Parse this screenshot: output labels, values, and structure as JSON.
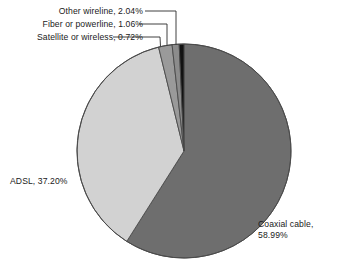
{
  "chart_data": {
    "type": "pie",
    "title": "",
    "subtitle": "",
    "xlabel": "",
    "ylabel": "",
    "legend_position": "none",
    "grid": false,
    "units": "percent",
    "start_angle_deg": 0,
    "direction": "clockwise",
    "categories": [
      "Coaxial cable",
      "ADSL",
      "Other wireline",
      "Fiber or powerline",
      "Satellite or wireless"
    ],
    "values": [
      58.99,
      37.2,
      2.04,
      1.06,
      0.72
    ],
    "labels": [
      "Coaxial cable, 58.99%",
      "ADSL, 37.20%",
      "Other wireline, 2.04%",
      "Fiber or powerline, 1.06%",
      "Satellite or wireless, 0.72%"
    ],
    "colors": [
      "#6e6e6e",
      "#d2d2d2",
      "#9a9a9a",
      "#8c8c8c",
      "#121212"
    ],
    "slices": [
      {
        "name": "Coaxial cable",
        "value": 58.99,
        "label": "Coaxial cable,",
        "label_line2": "58.99%",
        "color": "#6e6e6e"
      },
      {
        "name": "ADSL",
        "value": 37.2,
        "label": "ADSL, 37.20%",
        "color": "#d2d2d2"
      },
      {
        "name": "Other wireline",
        "value": 2.04,
        "label": "Other wireline, 2.04%",
        "color": "#9a9a9a"
      },
      {
        "name": "Fiber or powerline",
        "value": 1.06,
        "label": "Fiber or powerline, 1.06%",
        "color": "#8c8c8c"
      },
      {
        "name": "Satellite or wireless",
        "value": 0.72,
        "label": "Satellite or wireless, 0.72%",
        "color": "#121212"
      }
    ]
  },
  "callouts": {
    "other_wireline": "Other wireline, 2.04%",
    "fiber_or_powerline": "Fiber or powerline, 1.06%",
    "satellite_or_wireless": "Satellite or wireless, 0.72%"
  },
  "inner_labels": {
    "adsl": "ADSL, 37.20%",
    "coaxial_line1": "Coaxial cable,",
    "coaxial_line2": "58.99%"
  },
  "colors": {
    "background": "#ffffff",
    "outline": "#4a4a4a",
    "text": "#1a1a1a",
    "leader": "#2b2b2b"
  }
}
